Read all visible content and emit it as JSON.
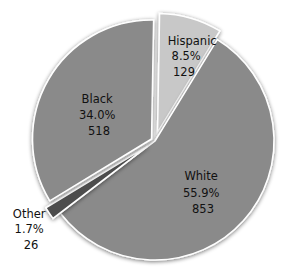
{
  "chart_data": {
    "type": "pie",
    "title": "",
    "exploded": true,
    "start_angle_deg_from_top": 0,
    "direction": "clockwise",
    "slices": [
      {
        "label": "Hispanic",
        "percent": "8.5%",
        "value": 129,
        "share": 8.5,
        "color": "#c8c8c8",
        "explode": 9,
        "label_color": "#111111"
      },
      {
        "label": "White",
        "percent": "55.9%",
        "value": 853,
        "share": 55.9,
        "color": "#8a8a8a",
        "explode": 0,
        "label_color": "#111111"
      },
      {
        "label": "Other",
        "percent": "1.7%",
        "value": 26,
        "share": 1.7,
        "color": "#4e4e4e",
        "explode": 9,
        "label_color": "#111111",
        "label_outside": true
      },
      {
        "label": "Black",
        "percent": "34.0%",
        "value": 518,
        "share": 34.0,
        "color": "#8a8a8a",
        "explode": 4,
        "label_color": "#111111"
      }
    ],
    "total": 1526
  }
}
